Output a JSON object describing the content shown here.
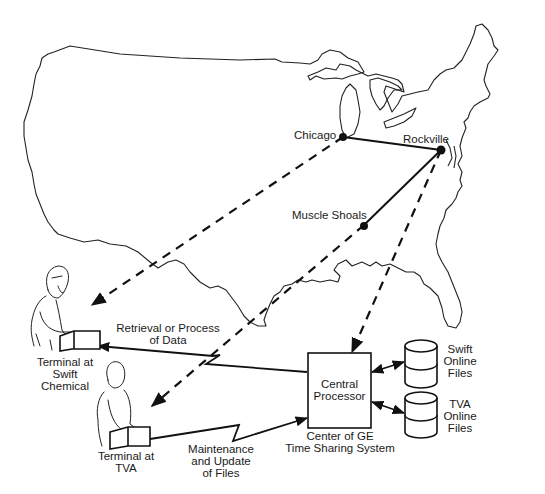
{
  "diagram": {
    "type": "network-map",
    "cities": [
      {
        "id": "chicago",
        "label": "Chicago"
      },
      {
        "id": "rockville",
        "label": "Rockville"
      },
      {
        "id": "muscle_shoals",
        "label": "Muscle Shoals"
      }
    ],
    "terminals": [
      {
        "id": "swift",
        "label_line1": "Terminal at",
        "label_line2": "Swift",
        "label_line3": "Chemical"
      },
      {
        "id": "tva",
        "label_line1": "Terminal at",
        "label_line2": "TVA"
      }
    ],
    "central": {
      "box_line1": "Central",
      "box_line2": "Processor",
      "caption_line1": "Center of GE",
      "caption_line2": "Time Sharing System"
    },
    "storage": [
      {
        "id": "swift_files",
        "line1": "Swift",
        "line2": "Online",
        "line3": "Files"
      },
      {
        "id": "tva_files",
        "line1": "TVA",
        "line2": "Online",
        "line3": "Files"
      }
    ],
    "links": [
      {
        "from": "chicago",
        "to": "rockville",
        "style": "solid"
      },
      {
        "from": "muscle_shoals",
        "to": "rockville",
        "style": "solid"
      },
      {
        "from": "chicago",
        "to": "swift",
        "style": "dashed"
      },
      {
        "from": "muscle_shoals",
        "to": "tva",
        "style": "dashed"
      },
      {
        "from": "rockville",
        "to": "central",
        "style": "dashed"
      },
      {
        "from": "central",
        "to": "swift",
        "style": "comm-line",
        "label_line1": "Retrieval or Process",
        "label_line2": "of Data"
      },
      {
        "from": "tva",
        "to": "central",
        "style": "comm-line",
        "label_line1": "Maintenance",
        "label_line2": "and Update",
        "label_line3": "of Files"
      },
      {
        "from": "central",
        "to": "swift_files",
        "style": "bidirectional"
      },
      {
        "from": "central",
        "to": "tva_files",
        "style": "bidirectional"
      }
    ]
  },
  "colors": {
    "background": "#ffffff",
    "ink": "#111111"
  }
}
